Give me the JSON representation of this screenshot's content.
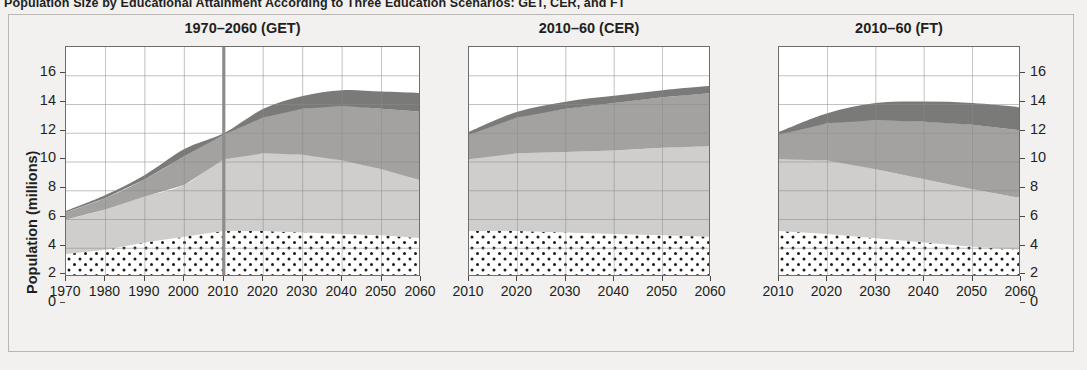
{
  "figure": {
    "title": "Population Size by Educational Attainment According to Three Education Scenarios: GET, CER, and FT",
    "ylabel": "Population (millions)",
    "y_ticks": [
      "0",
      "2",
      "4",
      "6",
      "8",
      "10",
      "12",
      "14",
      "16"
    ],
    "background_color": "#f2f1ef",
    "plot_background": "#ffffff",
    "grid_color": "#8d8b89",
    "axis_color": "#6f6d6b",
    "marker_line_color": "#8e8c8a"
  },
  "layer_colors": {
    "no_education": "#ffffff",
    "no_education_dots": "#1a1a1a",
    "primary": "#cfcecc",
    "secondary": "#a3a2a0",
    "tertiary": "#7a7a79"
  },
  "panels": [
    {
      "title": "1970–2060 (GET)",
      "x_ticks": [
        "1970",
        "1980",
        "1990",
        "2000",
        "2010",
        "2020",
        "2030",
        "2040",
        "2050",
        "2060"
      ],
      "marker_year": 2010
    },
    {
      "title": "2010–60 (CER)",
      "x_ticks": [
        "2010",
        "2020",
        "2030",
        "2040",
        "2050",
        "2060"
      ],
      "marker_year": null
    },
    {
      "title": "2010–60 (FT)",
      "x_ticks": [
        "2010",
        "2020",
        "2030",
        "2040",
        "2050",
        "2060"
      ],
      "marker_year": null
    }
  ],
  "chart_data": [
    {
      "type": "area",
      "title": "1970–2060 (GET)",
      "xlabel": "",
      "ylabel": "Population (millions)",
      "ylim": [
        0,
        16
      ],
      "xlim": [
        1970,
        2060
      ],
      "grid": true,
      "stacked": true,
      "x": [
        1970,
        1980,
        1990,
        2000,
        2010,
        2020,
        2030,
        2040,
        2050,
        2060
      ],
      "series": [
        {
          "name": "No education",
          "values": [
            1.6,
            1.9,
            2.4,
            2.8,
            3.2,
            3.2,
            3.1,
            3.0,
            2.9,
            2.7
          ]
        },
        {
          "name": "Primary",
          "values": [
            2.4,
            2.8,
            3.2,
            3.6,
            5.0,
            5.4,
            5.4,
            5.1,
            4.6,
            4.0
          ]
        },
        {
          "name": "Secondary",
          "values": [
            0.5,
            0.8,
            1.2,
            2.0,
            1.7,
            2.5,
            3.2,
            3.8,
            4.2,
            4.8
          ]
        },
        {
          "name": "Tertiary",
          "values": [
            0.1,
            0.2,
            0.3,
            0.5,
            0.1,
            0.6,
            0.9,
            1.1,
            1.2,
            1.3
          ]
        }
      ],
      "totals": [
        4.6,
        5.7,
        7.1,
        8.9,
        10.0,
        11.7,
        12.6,
        13.0,
        12.9,
        12.8
      ]
    },
    {
      "type": "area",
      "title": "2010–60 (CER)",
      "xlabel": "",
      "ylabel": "",
      "ylim": [
        0,
        16
      ],
      "xlim": [
        2010,
        2060
      ],
      "grid": true,
      "stacked": true,
      "x": [
        2010,
        2020,
        2030,
        2040,
        2050,
        2060
      ],
      "series": [
        {
          "name": "No education",
          "values": [
            3.2,
            3.2,
            3.1,
            3.0,
            2.9,
            2.8
          ]
        },
        {
          "name": "Primary",
          "values": [
            5.0,
            5.4,
            5.6,
            5.8,
            6.1,
            6.3
          ]
        },
        {
          "name": "Secondary",
          "values": [
            1.7,
            2.5,
            3.0,
            3.3,
            3.5,
            3.7
          ]
        },
        {
          "name": "Tertiary",
          "values": [
            0.2,
            0.4,
            0.5,
            0.5,
            0.5,
            0.5
          ]
        }
      ],
      "totals": [
        10.1,
        11.5,
        12.2,
        12.6,
        13.0,
        13.3
      ]
    },
    {
      "type": "area",
      "title": "2010–60 (FT)",
      "xlabel": "",
      "ylabel": "",
      "ylim": [
        0,
        16
      ],
      "xlim": [
        2010,
        2060
      ],
      "grid": true,
      "stacked": true,
      "x": [
        2010,
        2020,
        2030,
        2040,
        2050,
        2060
      ],
      "series": [
        {
          "name": "No education",
          "values": [
            3.2,
            3.0,
            2.7,
            2.4,
            2.1,
            1.9
          ]
        },
        {
          "name": "Primary",
          "values": [
            5.0,
            5.1,
            4.8,
            4.4,
            4.0,
            3.6
          ]
        },
        {
          "name": "Secondary",
          "values": [
            1.7,
            2.6,
            3.4,
            4.0,
            4.5,
            4.7
          ]
        },
        {
          "name": "Tertiary",
          "values": [
            0.2,
            0.7,
            1.2,
            1.4,
            1.5,
            1.6
          ]
        }
      ],
      "totals": [
        10.1,
        11.4,
        12.1,
        12.2,
        12.1,
        11.8
      ]
    }
  ]
}
